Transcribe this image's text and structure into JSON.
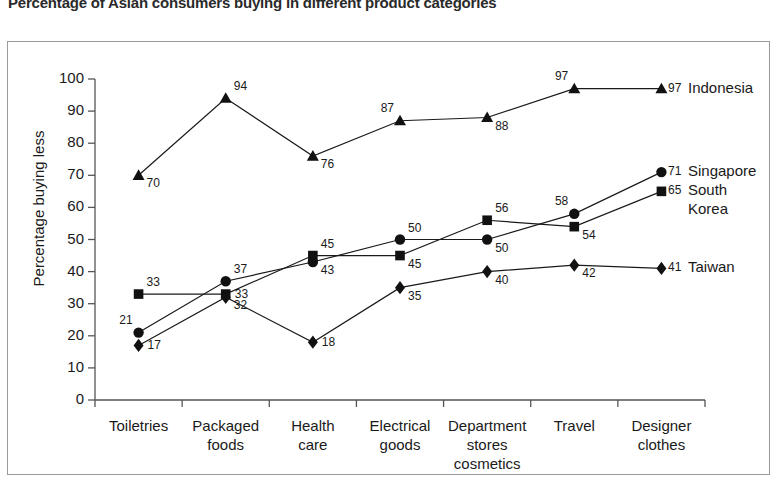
{
  "chart_data": {
    "type": "line",
    "title": "Percentage of Asian consumers buying in different product categories",
    "xlabel": "",
    "ylabel": "Percentage buying less",
    "ylim": [
      0,
      100
    ],
    "ytick_step": 10,
    "yticks": [
      "0",
      "10",
      "20",
      "30",
      "40",
      "50",
      "60",
      "70",
      "80",
      "90",
      "100"
    ],
    "grid": false,
    "legend_position": "right-inline",
    "categories": [
      [
        "Toiletries"
      ],
      [
        "Packaged",
        "foods"
      ],
      [
        "Health",
        "care"
      ],
      [
        "Electrical",
        "goods"
      ],
      [
        "Department",
        "stores",
        "cosmetics"
      ],
      [
        "Travel"
      ],
      [
        "Designer",
        "clothes"
      ]
    ],
    "series": [
      {
        "name": "Indonesia",
        "marker": "triangle",
        "values": [
          70,
          94,
          76,
          87,
          88,
          97,
          97
        ],
        "label_positions": [
          "right-below",
          "right-above",
          "right-below",
          "left-above",
          "right-below",
          "left-above",
          "right"
        ]
      },
      {
        "name": "Singapore",
        "marker": "circle",
        "values": [
          21,
          37,
          43,
          50,
          50,
          58,
          71
        ],
        "label_positions": [
          "left-above",
          "right-above",
          "right-below",
          "right-above",
          "right-below",
          "left-above",
          "right"
        ]
      },
      {
        "name": "South Korea",
        "marker": "square",
        "values": [
          33,
          33,
          45,
          45,
          56,
          54,
          65
        ],
        "label_positions": [
          "right-above",
          "right",
          "right-above",
          "right-below",
          "right-above",
          "right-below",
          "right"
        ]
      },
      {
        "name": "Taiwan",
        "marker": "diamond",
        "values": [
          17,
          32,
          18,
          35,
          40,
          42,
          41
        ],
        "label_positions": [
          "right",
          "right-below",
          "right",
          "right-below",
          "right-below",
          "right-below",
          "right"
        ]
      }
    ],
    "legend_entries": [
      {
        "label": "Indonesia",
        "end_value": "97",
        "marker": "triangle"
      },
      {
        "label": "Singapore",
        "end_value": "71",
        "marker": "circle"
      },
      {
        "label": "South Korea",
        "end_value": "65",
        "marker": "square"
      },
      {
        "label": "Taiwan",
        "end_value": "41",
        "marker": "diamond"
      }
    ],
    "colors": {
      "series_line": "#1a1a1a",
      "marker_fill": "#111111",
      "axis": "#555555",
      "frame": "#9a9a9a",
      "background": "#ffffff"
    }
  }
}
